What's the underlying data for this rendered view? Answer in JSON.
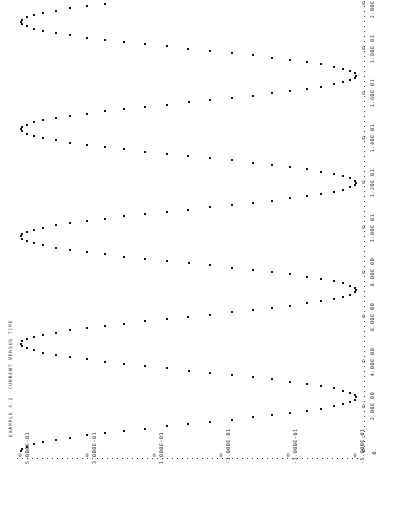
{
  "title": "EXAMPLE 4.2  CURRENT VERSUS TIME",
  "value_axis": {
    "orientation": "horizontal-bottom",
    "tick_zero_glyph": "0",
    "labels": [
      "5.000E-01",
      "3.000E-01",
      "1.000E-01",
      "-1.000E-01",
      "-3.000E-01",
      "-5.000E-01"
    ],
    "values": [
      0.5,
      0.3,
      0.1,
      -0.1,
      -0.3,
      -0.5
    ]
  },
  "time_axis": {
    "orientation": "vertical-right",
    "tick_zero_glyph": "0",
    "labels": [
      "2.00E 01",
      "1.80E 01",
      "1.60E 01",
      "1.40E 01",
      "1.20E 01",
      "1.00E 01",
      "8.00E 00",
      "6.00E 00",
      "4.00E 00",
      "2.00E 00",
      "0."
    ],
    "values": [
      20,
      18,
      16,
      14,
      12,
      10,
      8,
      6,
      4,
      2,
      0
    ]
  },
  "chart_data": {
    "type": "scatter",
    "title": "EXAMPLE 4.2  CURRENT VERSUS TIME",
    "xlabel": "CURRENT",
    "ylabel": "TIME",
    "grid": false,
    "legend": "none",
    "orientation": "rotated-90-line-printer-plot",
    "xlim": [
      -0.5,
      0.5
    ],
    "ylim": [
      0,
      20
    ],
    "xticks": [
      0.5,
      0.3,
      0.1,
      -0.1,
      -0.3,
      -0.5
    ],
    "xticklabels": [
      "5.000E-01",
      "3.000E-01",
      "1.000E-01",
      "-1.000E-01",
      "-3.000E-01",
      "-5.000E-01"
    ],
    "yticks": [
      20,
      18,
      16,
      14,
      12,
      10,
      8,
      6,
      4,
      2,
      0
    ],
    "yticklabels": [
      "2.00E 01",
      "1.80E 01",
      "1.60E 01",
      "1.40E 01",
      "1.20E 01",
      "1.00E 01",
      "8.00E 00",
      "6.00E 00",
      "4.00E 00",
      "2.00E 00",
      "0."
    ],
    "marker": "*",
    "marker_color": "#111111",
    "series": [
      {
        "name": "CURRENT",
        "function": "i(t) = 0.5 * cos(2*pi*t/4.8)",
        "amplitude": 0.5,
        "period": 4.8,
        "n_points": 201,
        "t": [
          0.0,
          0.1,
          0.2,
          0.3,
          0.4,
          0.5,
          0.6,
          0.7,
          0.8,
          0.9,
          1.0,
          1.1,
          1.2,
          1.3,
          1.4,
          1.5,
          1.6,
          1.7,
          1.8,
          1.9,
          2.0,
          2.1,
          2.2,
          2.3,
          2.4,
          2.5,
          2.6,
          2.7,
          2.8,
          2.9,
          3.0,
          3.1,
          3.2,
          3.3,
          3.4,
          3.5,
          3.6,
          3.7,
          3.8,
          3.9,
          4.0,
          4.1,
          4.2,
          4.3,
          4.4,
          4.5,
          4.6,
          4.7,
          4.8,
          4.9,
          5.0,
          5.5,
          6.0,
          6.5,
          7.0,
          7.5,
          8.0,
          8.5,
          9.0,
          9.5,
          10.0,
          10.5,
          11.0,
          11.5,
          12.0,
          12.5,
          13.0,
          13.5,
          14.0,
          14.5,
          15.0,
          15.5,
          16.0,
          16.5,
          17.0,
          17.5,
          18.0,
          18.5,
          19.0,
          19.5,
          20.0
        ],
        "i": [
          0.5,
          0.497,
          0.487,
          0.471,
          0.448,
          0.42,
          0.386,
          0.347,
          0.303,
          0.255,
          0.204,
          0.15,
          0.094,
          0.037,
          -0.021,
          -0.078,
          -0.134,
          -0.189,
          -0.24,
          -0.288,
          -0.332,
          -0.371,
          -0.405,
          -0.434,
          -0.457,
          -0.474,
          -0.484,
          -0.489,
          -0.487,
          -0.478,
          -0.463,
          -0.442,
          -0.415,
          -0.383,
          -0.346,
          -0.304,
          -0.259,
          -0.21,
          -0.159,
          -0.106,
          -0.051,
          0.004,
          0.059,
          0.113,
          0.165,
          0.215,
          0.262,
          0.306,
          0.346,
          0.381,
          0.411,
          0.48,
          0.472,
          0.388,
          0.238,
          0.046,
          -0.153,
          -0.325,
          -0.443,
          -0.492,
          -0.465,
          -0.366,
          -0.212,
          -0.026,
          0.162,
          0.33,
          0.45,
          0.499,
          0.477,
          0.381,
          0.235,
          0.046,
          -0.138,
          -0.314,
          -0.438,
          -0.497,
          -0.48,
          -0.391,
          -0.25,
          -0.076,
          0.108
        ]
      }
    ]
  }
}
